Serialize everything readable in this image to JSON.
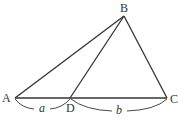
{
  "diagram": {
    "type": "triangle",
    "points": {
      "A": {
        "label": "A",
        "x": 15,
        "y": 98
      },
      "B": {
        "label": "B",
        "x": 124,
        "y": 16
      },
      "C": {
        "label": "C",
        "x": 167,
        "y": 98
      },
      "D": {
        "label": "D",
        "x": 70,
        "y": 98
      }
    },
    "segments": [
      "AB",
      "BC",
      "AC",
      "BD"
    ],
    "measures": {
      "AD": "a",
      "DC": "b"
    },
    "colors": {
      "stroke": "#333333",
      "background": "#ffffff"
    }
  }
}
